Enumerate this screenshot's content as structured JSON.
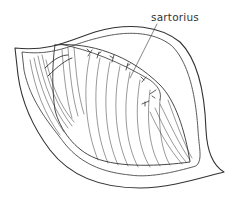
{
  "figure": {
    "type": "anatomical line drawing",
    "labels": [
      {
        "text": "sartorius",
        "x": 151,
        "y": 11
      }
    ],
    "stroke_color": "#333333",
    "background": "#ffffff"
  }
}
